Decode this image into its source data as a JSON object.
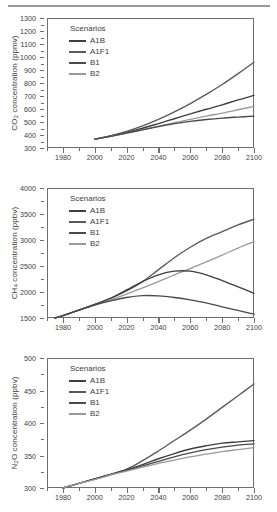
{
  "figure": {
    "background": "#ffffff",
    "axis_color": "#6e6e6e",
    "text_color": "#3d3d3d",
    "top_rule": true
  },
  "legend": {
    "title": "Scenarios",
    "entries": [
      {
        "label": "A1B",
        "color": "#3f3f3f"
      },
      {
        "label": "A1F1",
        "color": "#5a5a5a"
      },
      {
        "label": "B1",
        "color": "#4a4a4a"
      },
      {
        "label": "B2",
        "color": "#9a9a9a"
      }
    ]
  },
  "chart_data": [
    {
      "type": "line",
      "title": "",
      "xlabel": "",
      "ylabel": "CO2 concentration (ppmv)",
      "ylabel_parts": {
        "pre": "CO",
        "sub": "2",
        "post": " concentration (ppmv)"
      },
      "xlim": [
        1970,
        2100
      ],
      "ylim": [
        300,
        1300
      ],
      "xticks": [
        1980,
        2000,
        2020,
        2040,
        2060,
        2080,
        2100
      ],
      "yticks": [
        300,
        400,
        500,
        600,
        700,
        800,
        900,
        1000,
        1100,
        1200,
        1300
      ],
      "y_minor_step": 50,
      "x_minor_step": 10,
      "grid": false,
      "legend_position": "upper-left",
      "x": [
        2000,
        2010,
        2020,
        2030,
        2040,
        2050,
        2060,
        2070,
        2080,
        2090,
        2100
      ],
      "series": [
        {
          "name": "A1F1",
          "color": "#5a5a5a",
          "values": [
            368,
            395,
            428,
            470,
            520,
            578,
            642,
            712,
            788,
            872,
            960
          ]
        },
        {
          "name": "A1B",
          "color": "#3f3f3f",
          "values": [
            368,
            392,
            420,
            452,
            488,
            525,
            562,
            598,
            632,
            670,
            705
          ]
        },
        {
          "name": "B2",
          "color": "#9a9a9a",
          "values": [
            368,
            390,
            415,
            442,
            468,
            494,
            520,
            545,
            568,
            594,
            620
          ]
        },
        {
          "name": "B1",
          "color": "#4a4a4a",
          "values": [
            368,
            390,
            414,
            440,
            464,
            487,
            505,
            519,
            530,
            538,
            545
          ]
        }
      ]
    },
    {
      "type": "line",
      "title": "",
      "xlabel": "",
      "ylabel": "CH4 concentration (ppbv)",
      "ylabel_parts": {
        "pre": "CH",
        "sub": "4",
        "post": " concentration (ppbv)"
      },
      "xlim": [
        1970,
        2100
      ],
      "ylim": [
        1500,
        4000
      ],
      "xticks": [
        1980,
        2000,
        2020,
        2040,
        2060,
        2080,
        2100
      ],
      "yticks": [
        1500,
        2000,
        2500,
        3000,
        3500,
        4000
      ],
      "y_minor_step": 250,
      "x_minor_step": 10,
      "grid": false,
      "legend_position": "upper-left",
      "x": [
        1975,
        1980,
        1990,
        2000,
        2010,
        2020,
        2030,
        2040,
        2050,
        2060,
        2070,
        2080,
        2090,
        2100
      ],
      "series": [
        {
          "name": "A1F1",
          "color": "#5a5a5a",
          "values": [
            1500,
            1545,
            1650,
            1760,
            1880,
            2020,
            2200,
            2430,
            2660,
            2860,
            3030,
            3160,
            3290,
            3400
          ]
        },
        {
          "name": "B2",
          "color": "#9a9a9a",
          "values": [
            1500,
            1545,
            1650,
            1760,
            1850,
            1960,
            2080,
            2200,
            2330,
            2450,
            2580,
            2710,
            2845,
            2970
          ]
        },
        {
          "name": "A1B",
          "color": "#3f3f3f",
          "values": [
            1500,
            1545,
            1650,
            1760,
            1880,
            2040,
            2200,
            2330,
            2400,
            2400,
            2330,
            2220,
            2100,
            1975
          ]
        },
        {
          "name": "B1",
          "color": "#4a4a4a",
          "values": [
            1500,
            1545,
            1650,
            1750,
            1830,
            1895,
            1930,
            1925,
            1895,
            1850,
            1790,
            1715,
            1645,
            1575
          ]
        }
      ]
    },
    {
      "type": "line",
      "title": "",
      "xlabel": "",
      "ylabel": "N2O concentration (ppbv)",
      "ylabel_parts": {
        "pre": "N",
        "sub": "2",
        "post": "O concentration (ppbv)"
      },
      "xlim": [
        1970,
        2100
      ],
      "ylim": [
        300,
        500
      ],
      "xticks": [
        1980,
        2000,
        2020,
        2040,
        2060,
        2080,
        2100
      ],
      "yticks": [
        300,
        350,
        400,
        450,
        500
      ],
      "y_minor_step": 25,
      "x_minor_step": 10,
      "grid": false,
      "legend_position": "upper-left",
      "x": [
        1980,
        1990,
        2000,
        2010,
        2020,
        2030,
        2040,
        2050,
        2060,
        2070,
        2080,
        2090,
        2100
      ],
      "series": [
        {
          "name": "A1F1",
          "color": "#5a5a5a",
          "values": [
            300,
            307,
            314,
            321,
            329,
            342,
            357,
            373,
            389,
            406,
            424,
            442,
            460
          ]
        },
        {
          "name": "A1B",
          "color": "#3f3f3f",
          "values": [
            300,
            307,
            314,
            321,
            328,
            336,
            345,
            353,
            360,
            365,
            369,
            371,
            373
          ]
        },
        {
          "name": "B1",
          "color": "#4a4a4a",
          "values": [
            300,
            307,
            314,
            321,
            327,
            334,
            341,
            348,
            354,
            359,
            363,
            366,
            368
          ]
        },
        {
          "name": "B2",
          "color": "#9a9a9a",
          "values": [
            300,
            307,
            313,
            320,
            326,
            332,
            338,
            343,
            348,
            352,
            356,
            359,
            362
          ]
        }
      ]
    }
  ]
}
